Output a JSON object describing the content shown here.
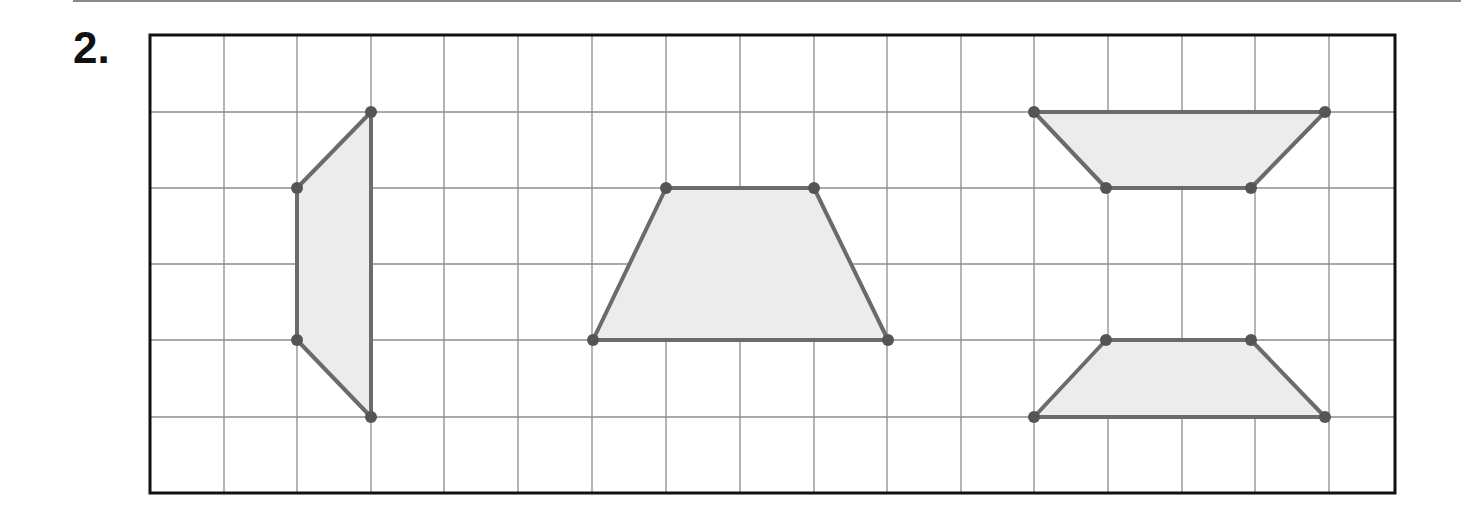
{
  "problem": {
    "number_label": "2."
  },
  "colors": {
    "grid_line": "#8c8c8c",
    "frame": "#111111",
    "shape_stroke": "#6b6b6b",
    "shape_fill": "#ececec",
    "vertex": "#555555",
    "top_rule": "#8a8a8a"
  },
  "grid": {
    "columns": 17,
    "rows": 6,
    "frame": {
      "x0": 150,
      "y0": 35,
      "x1": 1395,
      "y1": 493
    },
    "col_lines_x": [
      224,
      297,
      371,
      444,
      518,
      592,
      666,
      740,
      814,
      887,
      961,
      1034,
      1108,
      1182,
      1255,
      1329
    ],
    "row_lines_y": [
      112,
      188,
      264,
      340,
      417
    ]
  },
  "shapes": [
    {
      "name": "left-trapezoid",
      "type": "trapezoid",
      "vertices": [
        [
          371,
          112
        ],
        [
          297,
          188
        ],
        [
          297,
          340
        ],
        [
          371,
          417
        ]
      ]
    },
    {
      "name": "middle-trapezoid",
      "type": "trapezoid",
      "vertices": [
        [
          593,
          340
        ],
        [
          666,
          188
        ],
        [
          814,
          188
        ],
        [
          888,
          340
        ]
      ]
    },
    {
      "name": "right-top-trapezoid",
      "type": "trapezoid",
      "vertices": [
        [
          1034,
          112
        ],
        [
          1325,
          112
        ],
        [
          1251,
          188
        ],
        [
          1106,
          188
        ]
      ]
    },
    {
      "name": "right-bottom-trapezoid",
      "type": "trapezoid",
      "vertices": [
        [
          1106,
          340
        ],
        [
          1251,
          340
        ],
        [
          1325,
          417
        ],
        [
          1034,
          417
        ]
      ]
    }
  ]
}
